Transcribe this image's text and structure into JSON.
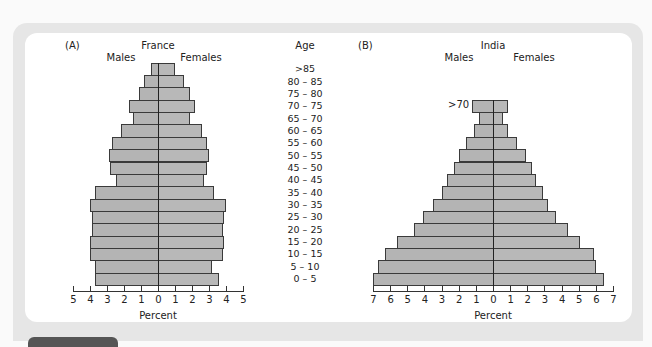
{
  "panelA": {
    "label": "(A)",
    "title": "France",
    "males_label": "Males",
    "females_label": "Females",
    "xlabel": "Percent"
  },
  "panelB": {
    "label": "(B)",
    "title": "India",
    "males_label": "Males",
    "females_label": "Females",
    "xlabel": "Percent",
    "top_annotation": ">70"
  },
  "age_header": "Age",
  "chart_data": [
    {
      "type": "bar",
      "orientation": "horizontal-population-pyramid",
      "title": "France",
      "panel": "(A)",
      "xlabel": "Percent",
      "ylabel": "Age",
      "xlim": [
        -5,
        5
      ],
      "xticks": [
        5,
        4,
        3,
        2,
        1,
        0,
        1,
        2,
        3,
        4,
        5
      ],
      "grid": false,
      "categories": [
        ">85",
        "80 – 85",
        "75 – 80",
        "70 – 75",
        "65 – 70",
        "60 – 65",
        "55 – 60",
        "50 – 55",
        "45 – 50",
        "40 – 45",
        "35 – 40",
        "30 – 35",
        "25 – 30",
        "20 – 25",
        "15 – 20",
        "10 – 15",
        "5 – 10",
        "0 – 5"
      ],
      "series": [
        {
          "name": "Males",
          "values": [
            0.4,
            0.8,
            1.1,
            1.7,
            1.5,
            2.2,
            2.7,
            2.9,
            2.8,
            2.5,
            3.7,
            4.0,
            3.9,
            3.9,
            4.0,
            4.0,
            3.7,
            3.7
          ]
        },
        {
          "name": "Females",
          "values": [
            1.0,
            1.5,
            1.9,
            2.2,
            1.9,
            2.6,
            2.9,
            3.0,
            2.9,
            2.7,
            3.3,
            4.0,
            3.9,
            3.8,
            3.9,
            3.8,
            3.2,
            3.6
          ]
        }
      ]
    },
    {
      "type": "bar",
      "orientation": "horizontal-population-pyramid",
      "title": "India",
      "panel": "(B)",
      "xlabel": "Percent",
      "ylabel": "Age",
      "xlim": [
        -7,
        7
      ],
      "xticks": [
        7,
        6,
        5,
        4,
        3,
        2,
        1,
        0,
        1,
        2,
        3,
        4,
        5,
        6,
        7
      ],
      "grid": false,
      "categories": [
        ">70",
        "65 – 70",
        "60 – 65",
        "55 – 60",
        "50 – 55",
        "45 – 50",
        "40 – 45",
        "35 – 40",
        "30 – 35",
        "25 – 30",
        "20 – 25",
        "15 – 20",
        "10 – 15",
        "5 – 10",
        "0 – 5"
      ],
      "series": [
        {
          "name": "Males",
          "values": [
            1.2,
            0.8,
            1.1,
            1.6,
            2.0,
            2.3,
            2.7,
            3.0,
            3.5,
            4.1,
            4.6,
            5.6,
            6.3,
            6.7,
            7.0
          ]
        },
        {
          "name": "Females",
          "values": [
            0.9,
            0.6,
            0.9,
            1.4,
            1.9,
            2.3,
            2.5,
            2.9,
            3.2,
            3.7,
            4.4,
            5.1,
            5.9,
            6.0,
            6.5
          ]
        }
      ]
    }
  ]
}
